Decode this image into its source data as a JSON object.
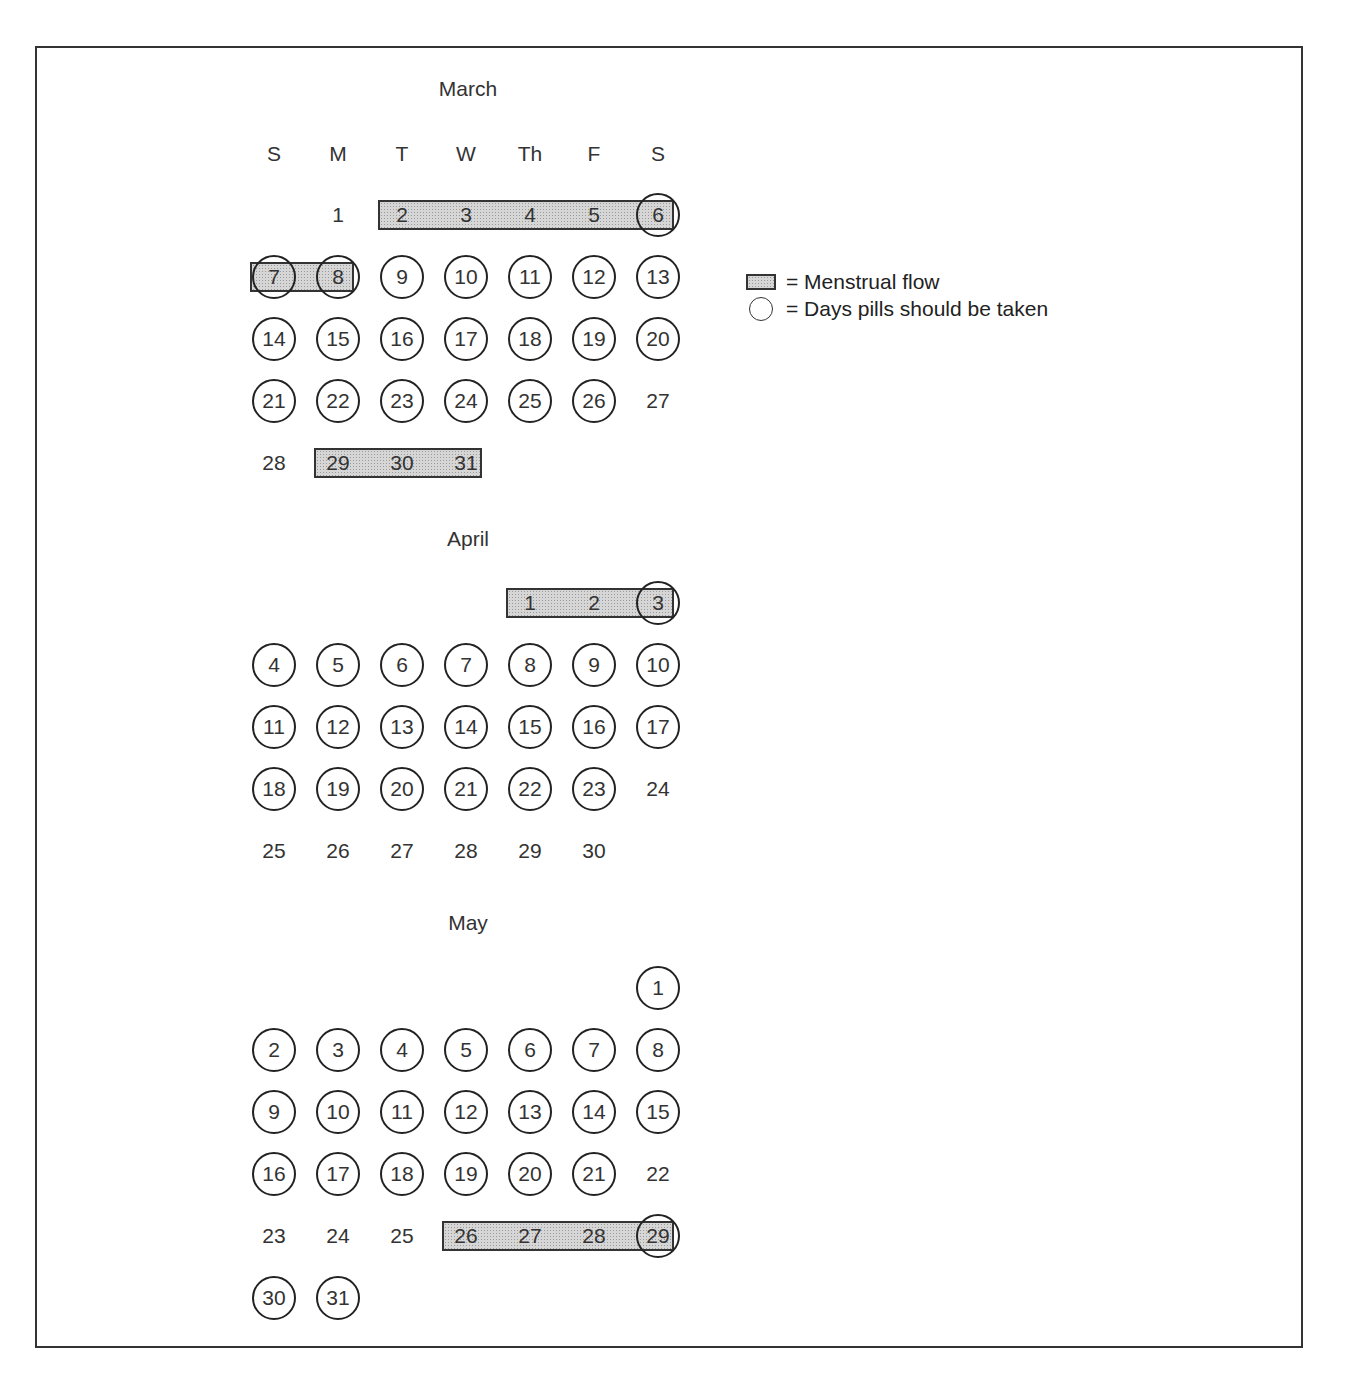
{
  "legend": {
    "flow_label": "= Menstrual flow",
    "pill_label": "= Days pills should be taken",
    "flow_icon": "shaded-rectangle",
    "pill_icon": "circle"
  },
  "weekdays": [
    "S",
    "M",
    "T",
    "W",
    "Th",
    "F",
    "S"
  ],
  "colors": {
    "flow_fill": "#d6d6d6",
    "stroke": "#222222"
  },
  "months": [
    {
      "name": "March",
      "start_col": 1,
      "days": 31,
      "pill_days": [
        6,
        7,
        8,
        9,
        10,
        11,
        12,
        13,
        14,
        15,
        16,
        17,
        18,
        19,
        20,
        21,
        22,
        23,
        24,
        25,
        26
      ],
      "flow_ranges": [
        [
          2,
          8
        ],
        [
          29,
          31
        ]
      ]
    },
    {
      "name": "April",
      "start_col": 4,
      "days": 30,
      "pill_days": [
        3,
        4,
        5,
        6,
        7,
        8,
        9,
        10,
        11,
        12,
        13,
        14,
        15,
        16,
        17,
        18,
        19,
        20,
        21,
        22,
        23
      ],
      "flow_ranges": [
        [
          1,
          3
        ]
      ]
    },
    {
      "name": "May",
      "start_col": 6,
      "days": 31,
      "pill_days": [
        1,
        2,
        3,
        4,
        5,
        6,
        7,
        8,
        9,
        10,
        11,
        12,
        13,
        14,
        15,
        16,
        17,
        18,
        19,
        20,
        21,
        29,
        30,
        31
      ],
      "flow_ranges": [
        [
          26,
          29
        ]
      ]
    }
  ]
}
